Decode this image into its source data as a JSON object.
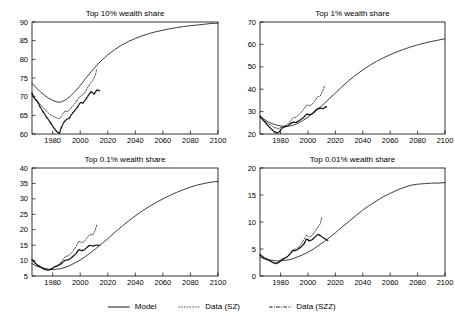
{
  "figure": {
    "legend": {
      "position": "bottom-center",
      "items": [
        {
          "label": "Model",
          "style": "solid",
          "name": "model"
        },
        {
          "label": "Data (SZ)",
          "style": "dotted",
          "name": "sz"
        },
        {
          "label": "Data (SZZ)",
          "style": "dash-dot",
          "name": "szz"
        }
      ]
    }
  },
  "chart_data": [
    {
      "type": "line",
      "id": "top10",
      "title": "Top 10% wealth share",
      "xlabel": "",
      "ylabel": "",
      "xlim": [
        1965,
        2100
      ],
      "ylim": [
        60,
        90
      ],
      "xticks": [
        1980,
        2000,
        2020,
        2040,
        2060,
        2080,
        2100
      ],
      "yticks": [
        60,
        65,
        70,
        75,
        80,
        85,
        90
      ],
      "grid": false,
      "series": [
        {
          "name": "Model",
          "x": [
            1965,
            1968,
            1971,
            1974,
            1977,
            1980,
            1983,
            1985,
            1987,
            1990,
            1993,
            1996,
            2000,
            2004,
            2008,
            2012,
            2016,
            2020,
            2025,
            2030,
            2035,
            2040,
            2045,
            2050,
            2055,
            2060,
            2065,
            2070,
            2075,
            2080,
            2085,
            2090,
            2095,
            2100
          ],
          "values": [
            73.6,
            72.4,
            71.3,
            70.4,
            69.6,
            69.0,
            68.6,
            68.5,
            68.7,
            69.3,
            70.2,
            71.3,
            73.0,
            74.9,
            76.7,
            78.4,
            79.9,
            81.2,
            82.6,
            83.8,
            84.8,
            85.6,
            86.3,
            86.9,
            87.4,
            87.8,
            88.2,
            88.5,
            88.8,
            89.0,
            89.2,
            89.4,
            89.6,
            89.7
          ]
        },
        {
          "name": "Data (SZ)",
          "x": [
            1965,
            1967,
            1969,
            1971,
            1973,
            1975,
            1977,
            1979,
            1981,
            1983,
            1985,
            1987,
            1989,
            1991,
            1993,
            1995,
            1997,
            1999,
            2001,
            2003,
            2005,
            2007,
            2009,
            2011,
            2012
          ],
          "values": [
            70.6,
            69.6,
            68.8,
            67.9,
            67.1,
            66.3,
            65.6,
            65.0,
            64.6,
            64.3,
            64.1,
            65.1,
            66.2,
            66.0,
            66.8,
            67.7,
            68.6,
            69.8,
            70.3,
            70.9,
            72.2,
            73.4,
            74.3,
            75.8,
            77.3
          ]
        },
        {
          "name": "Data (SZZ)",
          "x": [
            1965,
            1967,
            1969,
            1971,
            1973,
            1975,
            1977,
            1979,
            1981,
            1983,
            1985,
            1986,
            1988,
            1990,
            1992,
            1994,
            1996,
            1998,
            2000,
            2002,
            2004,
            2006,
            2008,
            2010,
            2012,
            2014
          ],
          "values": [
            70.9,
            69.4,
            68.7,
            67.2,
            66.0,
            64.8,
            63.8,
            62.7,
            61.6,
            60.6,
            60.2,
            61.5,
            63.1,
            63.9,
            64.2,
            65.4,
            66.3,
            67.2,
            68.4,
            68.3,
            69.3,
            70.4,
            71.4,
            70.7,
            71.8,
            71.6
          ]
        }
      ]
    },
    {
      "type": "line",
      "id": "top1",
      "title": "Top 1% wealth share",
      "xlabel": "",
      "ylabel": "",
      "xlim": [
        1965,
        2100
      ],
      "ylim": [
        20,
        70
      ],
      "xticks": [
        1980,
        2000,
        2020,
        2040,
        2060,
        2080,
        2100
      ],
      "yticks": [
        20,
        30,
        40,
        50,
        60,
        70
      ],
      "grid": false,
      "series": [
        {
          "name": "Model",
          "x": [
            1965,
            1968,
            1971,
            1974,
            1977,
            1980,
            1983,
            1986,
            1989,
            1992,
            1996,
            2000,
            2004,
            2008,
            2012,
            2016,
            2020,
            2025,
            2030,
            2035,
            2040,
            2045,
            2050,
            2055,
            2060,
            2065,
            2070,
            2075,
            2080,
            2085,
            2090,
            2095,
            2100
          ],
          "values": [
            28.0,
            26.6,
            25.4,
            24.6,
            24.0,
            23.6,
            23.4,
            23.5,
            23.9,
            24.6,
            25.9,
            27.5,
            29.4,
            31.5,
            33.7,
            36.0,
            38.3,
            41.2,
            43.9,
            46.4,
            48.6,
            50.6,
            52.4,
            54.0,
            55.4,
            56.7,
            57.8,
            58.9,
            59.8,
            60.6,
            61.3,
            61.9,
            62.5
          ]
        },
        {
          "name": "Data (SZ)",
          "x": [
            1965,
            1967,
            1969,
            1971,
            1973,
            1975,
            1977,
            1979,
            1981,
            1983,
            1985,
            1987,
            1989,
            1991,
            1993,
            1995,
            1997,
            1999,
            2001,
            2003,
            2005,
            2007,
            2009,
            2011,
            2012
          ],
          "values": [
            27.8,
            26.6,
            25.6,
            24.6,
            23.9,
            23.1,
            22.6,
            22.5,
            23.2,
            23.6,
            24.3,
            25.6,
            27.2,
            27.5,
            28.4,
            29.6,
            31.2,
            32.9,
            32.7,
            33.2,
            34.8,
            36.5,
            37.0,
            39.5,
            41.3
          ]
        },
        {
          "name": "Data (SZZ)",
          "x": [
            1965,
            1967,
            1969,
            1971,
            1973,
            1975,
            1977,
            1979,
            1981,
            1983,
            1985,
            1987,
            1989,
            1991,
            1993,
            1995,
            1997,
            1999,
            2001,
            2003,
            2005,
            2007,
            2009,
            2011,
            2013,
            2014
          ],
          "values": [
            27.9,
            26.4,
            25.1,
            23.6,
            22.4,
            21.2,
            20.4,
            20.9,
            22.6,
            23.2,
            23.6,
            24.5,
            25.3,
            25.1,
            25.7,
            26.6,
            27.5,
            28.9,
            28.6,
            29.0,
            30.2,
            31.3,
            31.5,
            31.3,
            32.2,
            32.1
          ]
        }
      ]
    },
    {
      "type": "line",
      "id": "top01",
      "title": "Top 0.1% wealth share",
      "xlabel": "",
      "ylabel": "",
      "xlim": [
        1965,
        2100
      ],
      "ylim": [
        5,
        40
      ],
      "xticks": [
        1980,
        2000,
        2020,
        2040,
        2060,
        2080,
        2100
      ],
      "yticks": [
        5,
        10,
        15,
        20,
        25,
        30,
        35,
        40
      ],
      "grid": false,
      "series": [
        {
          "name": "Model",
          "x": [
            1965,
            1968,
            1971,
            1974,
            1977,
            1980,
            1983,
            1986,
            1989,
            1992,
            1996,
            2000,
            2004,
            2008,
            2012,
            2016,
            2020,
            2025,
            2030,
            2035,
            2040,
            2045,
            2050,
            2055,
            2060,
            2065,
            2070,
            2075,
            2080,
            2085,
            2090,
            2095,
            2100
          ],
          "values": [
            9.0,
            8.3,
            7.8,
            7.4,
            7.2,
            7.1,
            7.2,
            7.4,
            7.8,
            8.3,
            9.2,
            10.2,
            11.4,
            12.7,
            14.1,
            15.6,
            17.1,
            19.1,
            21.0,
            22.8,
            24.5,
            26.1,
            27.5,
            28.8,
            30.0,
            31.1,
            32.1,
            33.0,
            33.8,
            34.5,
            35.0,
            35.4,
            35.7
          ]
        },
        {
          "name": "Data (SZ)",
          "x": [
            1965,
            1967,
            1969,
            1971,
            1973,
            1975,
            1977,
            1979,
            1981,
            1983,
            1985,
            1987,
            1989,
            1991,
            1993,
            1995,
            1997,
            1999,
            2001,
            2003,
            2005,
            2007,
            2009,
            2011,
            2012
          ],
          "values": [
            10.2,
            9.4,
            8.7,
            8.2,
            7.7,
            7.3,
            7.1,
            7.3,
            7.9,
            8.3,
            9.0,
            10.0,
            11.3,
            11.5,
            12.1,
            13.2,
            14.6,
            16.3,
            15.8,
            16.2,
            17.4,
            18.5,
            18.2,
            20.0,
            21.6
          ]
        },
        {
          "name": "Data (SZZ)",
          "x": [
            1965,
            1967,
            1969,
            1971,
            1973,
            1975,
            1977,
            1979,
            1981,
            1983,
            1985,
            1987,
            1989,
            1991,
            1993,
            1995,
            1997,
            1999,
            2001,
            2003,
            2005,
            2007,
            2009,
            2011,
            2013,
            2014
          ],
          "values": [
            10.3,
            9.3,
            8.5,
            7.9,
            7.4,
            7.0,
            6.9,
            7.2,
            7.9,
            8.2,
            8.6,
            9.3,
            10.1,
            10.2,
            10.7,
            11.5,
            12.3,
            13.6,
            13.2,
            13.5,
            14.3,
            15.0,
            14.7,
            14.9,
            15.0,
            14.9
          ]
        }
      ]
    },
    {
      "type": "line",
      "id": "top001",
      "title": "Top 0.01% wealth share",
      "xlabel": "",
      "ylabel": "",
      "xlim": [
        1965,
        2100
      ],
      "ylim": [
        0,
        20
      ],
      "xticks": [
        1980,
        2000,
        2020,
        2040,
        2060,
        2080,
        2100
      ],
      "yticks": [
        0,
        5,
        10,
        15,
        20
      ],
      "grid": false,
      "series": [
        {
          "name": "Model",
          "x": [
            1965,
            1968,
            1971,
            1974,
            1977,
            1980,
            1983,
            1986,
            1989,
            1992,
            1996,
            2000,
            2004,
            2008,
            2012,
            2016,
            2020,
            2025,
            2030,
            2035,
            2040,
            2045,
            2050,
            2055,
            2060,
            2065,
            2070,
            2075,
            2080,
            2085,
            2090,
            2095,
            2100
          ],
          "values": [
            3.5,
            3.2,
            3.0,
            2.9,
            2.8,
            2.8,
            2.9,
            3.0,
            3.2,
            3.5,
            3.9,
            4.4,
            5.0,
            5.7,
            6.4,
            7.2,
            8.0,
            9.1,
            10.1,
            11.2,
            12.2,
            13.1,
            13.9,
            14.7,
            15.3,
            15.9,
            16.4,
            16.8,
            17.0,
            17.1,
            17.2,
            17.2,
            17.3
          ]
        },
        {
          "name": "Data (SZ)",
          "x": [
            1965,
            1967,
            1969,
            1971,
            1973,
            1975,
            1977,
            1979,
            1981,
            1983,
            1985,
            1987,
            1989,
            1991,
            1993,
            1995,
            1997,
            1999,
            2001,
            2003,
            2005,
            2007,
            2009,
            2010
          ],
          "values": [
            4.0,
            3.6,
            3.3,
            3.1,
            2.8,
            2.5,
            2.4,
            2.6,
            3.0,
            3.2,
            3.6,
            4.1,
            4.9,
            5.0,
            5.3,
            5.9,
            6.7,
            7.6,
            7.2,
            7.5,
            8.2,
            8.9,
            9.7,
            10.8
          ]
        },
        {
          "name": "Data (SZZ)",
          "x": [
            1965,
            1967,
            1969,
            1971,
            1973,
            1975,
            1977,
            1979,
            1981,
            1983,
            1985,
            1987,
            1989,
            1991,
            1993,
            1995,
            1997,
            1999,
            2001,
            2003,
            2005,
            2007,
            2009,
            2011,
            2013,
            2015
          ],
          "values": [
            4.0,
            3.5,
            3.2,
            3.0,
            2.7,
            2.4,
            2.3,
            2.6,
            3.1,
            3.3,
            3.6,
            4.1,
            4.7,
            4.7,
            5.0,
            5.4,
            5.9,
            6.9,
            6.5,
            6.7,
            7.2,
            7.7,
            7.5,
            7.1,
            6.8,
            6.5
          ]
        }
      ]
    }
  ]
}
